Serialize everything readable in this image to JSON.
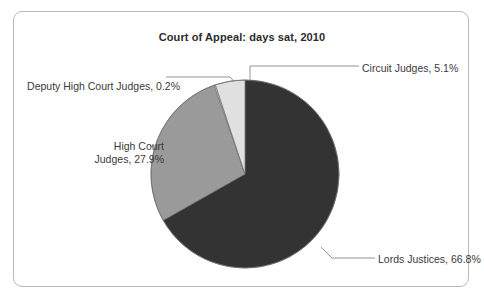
{
  "card": {
    "background": "#ffffff",
    "border_color": "#b9b9b9"
  },
  "chart_data": {
    "type": "pie",
    "title": "Court of Appeal: days sat, 2010",
    "xlabel": "",
    "ylabel": "",
    "legend_position": "callout-labels",
    "grid": false,
    "unit": "%",
    "start_angle_deg": 0,
    "direction": "clockwise",
    "categories": [
      "Lords Justices",
      "High Court Judges",
      "Deputy High Court Judges",
      "Circuit Judges"
    ],
    "values": [
      66.8,
      27.9,
      0.2,
      5.1
    ],
    "colors": [
      "#333333",
      "#9a9a9a",
      "#fbfbfb",
      "#e0e0e0"
    ],
    "slices": [
      {
        "name": "Lords Justices",
        "value": 66.8,
        "label": "Lords Justices, 66.8%",
        "color": "#333333",
        "start_deg": 0,
        "end_deg": 240.48
      },
      {
        "name": "High Court Judges",
        "value": 27.9,
        "label": "High Court Judges, 27.9%",
        "label_line1": "High Court",
        "label_line2": "Judges, 27.9%",
        "color": "#9a9a9a",
        "start_deg": 240.48,
        "end_deg": 340.92
      },
      {
        "name": "Deputy High Court Judges",
        "value": 0.2,
        "label": "Deputy High Court Judges, 0.2%",
        "color": "#fbfbfb",
        "start_deg": 340.92,
        "end_deg": 341.64
      },
      {
        "name": "Circuit Judges",
        "value": 5.1,
        "label": "Circuit Judges, 5.1%",
        "color": "#e0e0e0",
        "start_deg": 341.64,
        "end_deg": 360
      }
    ]
  },
  "labels": {
    "circuit_judges": "Circuit Judges, 5.1%",
    "deputy_high_court_judges": "Deputy High Court Judges, 0.2%",
    "high_court_judges_line1": "High Court",
    "high_court_judges_line2": "Judges, 27.9%",
    "lords_justices": "Lords Justices, 66.8%"
  }
}
